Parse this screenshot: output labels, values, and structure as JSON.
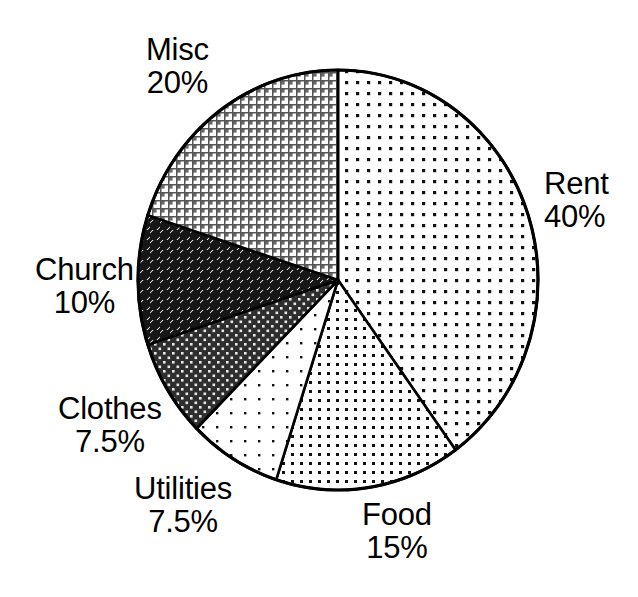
{
  "chart_data": {
    "type": "pie",
    "title": "",
    "subtitle": "",
    "xlabel": "",
    "ylabel": "",
    "legend_position": "none",
    "grid": false,
    "start_angle_deg": 90,
    "direction": "clockwise",
    "units": "percent",
    "categories": [
      "Rent",
      "Food",
      "Utilities",
      "Clothes",
      "Church",
      "Misc"
    ],
    "values": [
      40,
      15,
      7.5,
      7.5,
      10,
      20
    ],
    "labels": [
      "40%",
      "15%",
      "7.5%",
      "7.5%",
      "10%",
      "20%"
    ],
    "slices": [
      {
        "name": "Rent",
        "value": 40,
        "value_label": "40%",
        "sweep_deg": 144,
        "start_deg": 0,
        "end_deg": 144,
        "fill": "fine-dot-light",
        "label_position": "right"
      },
      {
        "name": "Food",
        "value": 15,
        "value_label": "15%",
        "sweep_deg": 54,
        "start_deg": 144,
        "end_deg": 198,
        "fill": "medium-dot",
        "label_position": "bottom"
      },
      {
        "name": "Utilities",
        "value": 7.5,
        "value_label": "7.5%",
        "sweep_deg": 27,
        "start_deg": 198,
        "end_deg": 225,
        "fill": "sparse-dot",
        "label_position": "bottom-left"
      },
      {
        "name": "Clothes",
        "value": 7.5,
        "value_label": "7.5%",
        "sweep_deg": 27,
        "start_deg": 225,
        "end_deg": 252,
        "fill": "dark-dot",
        "label_position": "left"
      },
      {
        "name": "Church",
        "value": 10,
        "value_label": "10%",
        "sweep_deg": 36,
        "start_deg": 252,
        "end_deg": 288,
        "fill": "dark-crosshatch",
        "label_position": "left"
      },
      {
        "name": "Misc",
        "value": 20,
        "value_label": "20%",
        "sweep_deg": 72,
        "start_deg": 288,
        "end_deg": 360,
        "fill": "gray-grid",
        "label_position": "top-left"
      }
    ],
    "geometry": {
      "center_x": 338,
      "center_y": 280,
      "radius_x": 200,
      "radius_y": 210
    },
    "colors": {
      "outline": "#000000",
      "background": "#ffffff",
      "ink": "#000000"
    }
  },
  "labels": {
    "rent": {
      "name": "Rent",
      "value": "40%"
    },
    "food": {
      "name": "Food",
      "value": "15%"
    },
    "utilities": {
      "name": "Utilities",
      "value": "7.5%"
    },
    "clothes": {
      "name": "Clothes",
      "value": "7.5%"
    },
    "church": {
      "name": "Church",
      "value": "10%"
    },
    "misc": {
      "name": "Misc",
      "value": "20%"
    }
  }
}
